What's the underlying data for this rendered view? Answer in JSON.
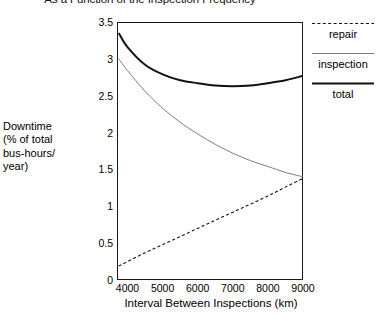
{
  "chart_data": {
    "type": "line",
    "title": "As a Function of the Inspection Frequency",
    "xlabel": "Interval Between Inspections (km)",
    "ylabel": "Downtime (% of total bus-hours/ year)",
    "ylabel_lines": [
      "Downtime",
      "(% of total",
      "bus-hours/",
      "year)"
    ],
    "xlim": [
      3700,
      9000
    ],
    "ylim": [
      0,
      3.5
    ],
    "xticks": [
      4000,
      5000,
      6000,
      7000,
      8000,
      9000
    ],
    "xtick_labels": [
      "4000",
      "5000",
      "6000",
      "7000",
      "8000",
      "9000"
    ],
    "yticks": [
      0,
      0.5,
      1,
      1.5,
      2,
      2.5,
      3,
      3.5
    ],
    "ytick_labels": [
      "0",
      "0.5",
      "1",
      "1.5",
      "2",
      "2.5",
      "3",
      "3.5"
    ],
    "grid": false,
    "legend_position": "right",
    "x": [
      3750,
      4000,
      4500,
      5000,
      5500,
      6000,
      6500,
      7000,
      7500,
      8000,
      8500,
      9000
    ],
    "series": [
      {
        "name": "repair",
        "style": "dashed",
        "color": "#111111",
        "width": 1.1,
        "values": [
          0.19,
          0.25,
          0.37,
          0.48,
          0.59,
          0.7,
          0.81,
          0.92,
          1.03,
          1.14,
          1.26,
          1.38
        ]
      },
      {
        "name": "inspection",
        "style": "thin",
        "color": "#6e6e6e",
        "width": 0.9,
        "values": [
          3.0,
          2.84,
          2.56,
          2.33,
          2.14,
          1.98,
          1.84,
          1.72,
          1.62,
          1.54,
          1.46,
          1.4
        ]
      },
      {
        "name": "total",
        "style": "solid",
        "color": "#111111",
        "width": 2.0,
        "values": [
          3.35,
          3.16,
          2.92,
          2.79,
          2.71,
          2.67,
          2.64,
          2.63,
          2.64,
          2.67,
          2.71,
          2.77
        ]
      }
    ],
    "legend": [
      {
        "label": "repair",
        "style": "dashed"
      },
      {
        "label": "inspection",
        "style": "thin"
      },
      {
        "label": "total",
        "style": "solid"
      }
    ]
  }
}
